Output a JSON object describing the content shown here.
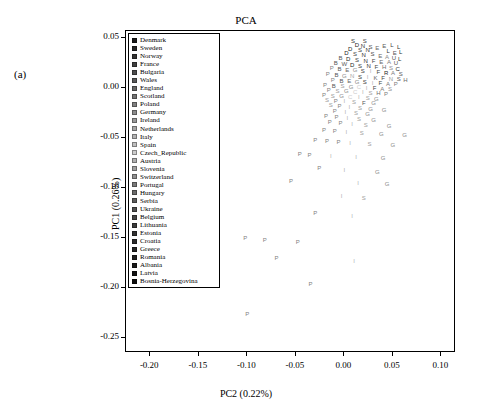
{
  "figure": {
    "panel_label": "(a)",
    "title": "PCA"
  },
  "chart_data": {
    "type": "scatter",
    "title": "PCA",
    "xlabel": "PC2 (0.22%)",
    "ylabel": "PC1 (0.26%)",
    "xlim": [
      -0.225,
      0.115
    ],
    "ylim": [
      -0.265,
      0.057
    ],
    "xticks": [
      "-0.20",
      "-0.15",
      "-0.10",
      "-0.05",
      "0.00",
      "0.05",
      "0.10"
    ],
    "xtickvals": [
      -0.2,
      -0.15,
      -0.1,
      -0.05,
      0.0,
      0.05,
      0.1
    ],
    "yticks": [
      "0.05",
      "0.00",
      "-0.05",
      "-0.10",
      "-0.15",
      "-0.20",
      "-0.25"
    ],
    "ytickvals": [
      0.05,
      0.0,
      -0.05,
      -0.1,
      -0.15,
      -0.2,
      -0.25
    ],
    "grid": false,
    "legend_position": "top-left-inside",
    "legend_title": "",
    "legend": [
      {
        "label": "Denmark",
        "color": "#1a1a1a"
      },
      {
        "label": "Sweden",
        "color": "#262626"
      },
      {
        "label": "Norway",
        "color": "#333333"
      },
      {
        "label": "France",
        "color": "#404040"
      },
      {
        "label": "Bulgaria",
        "color": "#4d4d4d"
      },
      {
        "label": "Wales",
        "color": "#595959"
      },
      {
        "label": "England",
        "color": "#666666"
      },
      {
        "label": "Scotland",
        "color": "#737373"
      },
      {
        "label": "Poland",
        "color": "#808080"
      },
      {
        "label": "Germany",
        "color": "#8c8c8c"
      },
      {
        "label": "Ireland",
        "color": "#999999"
      },
      {
        "label": "Netherlands",
        "color": "#a6a6a6"
      },
      {
        "label": "Italy",
        "color": "#b3b3b3"
      },
      {
        "label": "Spain",
        "color": "#bfbfbf"
      },
      {
        "label": "Czech_Republic",
        "color": "#cccccc"
      },
      {
        "label": "Austria",
        "color": "#b0b0b0"
      },
      {
        "label": "Slovenia",
        "color": "#a0a0a0"
      },
      {
        "label": "Switzerland",
        "color": "#909090"
      },
      {
        "label": "Portugal",
        "color": "#7a7a7a"
      },
      {
        "label": "Hungary",
        "color": "#6b6b6b"
      },
      {
        "label": "Serbia",
        "color": "#5c5c5c"
      },
      {
        "label": "Ukraine",
        "color": "#4f4f4f"
      },
      {
        "label": "Belgium",
        "color": "#444444"
      },
      {
        "label": "Lithuania",
        "color": "#3b3b3b"
      },
      {
        "label": "Estonia",
        "color": "#323232"
      },
      {
        "label": "Croatia",
        "color": "#2b2b2b"
      },
      {
        "label": "Greece",
        "color": "#242424"
      },
      {
        "label": "Romania",
        "color": "#1f1f1f"
      },
      {
        "label": "Albania",
        "color": "#191919"
      },
      {
        "label": "Latvia",
        "color": "#121212"
      },
      {
        "label": "Bosnia-Herzegovina",
        "color": "#0d0d0d"
      }
    ],
    "points": [
      {
        "x": 0.009,
        "y": 0.047,
        "t": "S",
        "c": "#333"
      },
      {
        "x": 0.021,
        "y": 0.047,
        "t": "S",
        "c": "#444"
      },
      {
        "x": 0.013,
        "y": 0.043,
        "t": "D",
        "c": "#222"
      },
      {
        "x": 0.019,
        "y": 0.042,
        "t": "N",
        "c": "#333"
      },
      {
        "x": 0.027,
        "y": 0.041,
        "t": "S",
        "c": "#555"
      },
      {
        "x": 0.006,
        "y": 0.039,
        "t": "D",
        "c": "#222"
      },
      {
        "x": 0.016,
        "y": 0.038,
        "t": "S",
        "c": "#3a3a3a"
      },
      {
        "x": 0.024,
        "y": 0.038,
        "t": "N",
        "c": "#2e2e2e"
      },
      {
        "x": 0.034,
        "y": 0.04,
        "t": "E",
        "c": "#666"
      },
      {
        "x": 0.041,
        "y": 0.042,
        "t": "E",
        "c": "#5a5a5a"
      },
      {
        "x": 0.049,
        "y": 0.043,
        "t": "L",
        "c": "#3a3a3a"
      },
      {
        "x": 0.056,
        "y": 0.041,
        "t": "L",
        "c": "#2a2a2a"
      },
      {
        "x": 0.045,
        "y": 0.037,
        "t": "L",
        "c": "#333"
      },
      {
        "x": 0.052,
        "y": 0.035,
        "t": "E",
        "c": "#555"
      },
      {
        "x": 0.058,
        "y": 0.036,
        "t": "L",
        "c": "#2a2a2a"
      },
      {
        "x": 0.002,
        "y": 0.035,
        "t": "D",
        "c": "#222"
      },
      {
        "x": 0.011,
        "y": 0.034,
        "t": "S",
        "c": "#3f3f3f"
      },
      {
        "x": 0.02,
        "y": 0.033,
        "t": "N",
        "c": "#2c2c2c"
      },
      {
        "x": 0.029,
        "y": 0.034,
        "t": "S",
        "c": "#4a4a4a"
      },
      {
        "x": 0.037,
        "y": 0.032,
        "t": "E",
        "c": "#666"
      },
      {
        "x": 0.044,
        "y": 0.031,
        "t": "A",
        "c": "#888"
      },
      {
        "x": 0.051,
        "y": 0.03,
        "t": "U",
        "c": "#4f4f4f"
      },
      {
        "x": 0.057,
        "y": 0.029,
        "t": "L",
        "c": "#2a2a2a"
      },
      {
        "x": -0.004,
        "y": 0.03,
        "t": "B",
        "c": "#555"
      },
      {
        "x": 0.004,
        "y": 0.029,
        "t": "D",
        "c": "#222"
      },
      {
        "x": 0.013,
        "y": 0.028,
        "t": "S",
        "c": "#3a3a3a"
      },
      {
        "x": 0.022,
        "y": 0.027,
        "t": "N",
        "c": "#2e2e2e"
      },
      {
        "x": 0.03,
        "y": 0.027,
        "t": "F",
        "c": "#444"
      },
      {
        "x": 0.038,
        "y": 0.026,
        "t": "E",
        "c": "#666"
      },
      {
        "x": 0.046,
        "y": 0.026,
        "t": "A",
        "c": "#7a7a7a"
      },
      {
        "x": 0.053,
        "y": 0.025,
        "t": "U",
        "c": "#4f4f4f"
      },
      {
        "x": -0.009,
        "y": 0.025,
        "t": "B",
        "c": "#555"
      },
      {
        "x": 0.0,
        "y": 0.024,
        "t": "W",
        "c": "#5c5c5c"
      },
      {
        "x": 0.008,
        "y": 0.023,
        "t": "D",
        "c": "#222"
      },
      {
        "x": 0.016,
        "y": 0.022,
        "t": "S",
        "c": "#3a3a3a"
      },
      {
        "x": 0.025,
        "y": 0.022,
        "t": "N",
        "c": "#2e2e2e"
      },
      {
        "x": 0.033,
        "y": 0.021,
        "t": "F",
        "c": "#444"
      },
      {
        "x": 0.041,
        "y": 0.021,
        "t": "H",
        "c": "#6b6b6b"
      },
      {
        "x": 0.048,
        "y": 0.02,
        "t": "S",
        "c": "#8c8c8c"
      },
      {
        "x": 0.055,
        "y": 0.019,
        "t": "C",
        "c": "#2b2b2b"
      },
      {
        "x": -0.013,
        "y": 0.02,
        "t": "P",
        "c": "#808080"
      },
      {
        "x": -0.005,
        "y": 0.019,
        "t": "B",
        "c": "#555"
      },
      {
        "x": 0.003,
        "y": 0.018,
        "t": "E",
        "c": "#666"
      },
      {
        "x": 0.011,
        "y": 0.018,
        "t": "G",
        "c": "#8c8c8c"
      },
      {
        "x": 0.019,
        "y": 0.017,
        "t": "S",
        "c": "#3a3a3a"
      },
      {
        "x": 0.027,
        "y": 0.017,
        "t": "I",
        "c": "#b3b3b3"
      },
      {
        "x": 0.035,
        "y": 0.016,
        "t": "F",
        "c": "#444"
      },
      {
        "x": 0.043,
        "y": 0.015,
        "t": "R",
        "c": "#1f1f1f"
      },
      {
        "x": 0.05,
        "y": 0.015,
        "t": "A",
        "c": "#7a7a7a"
      },
      {
        "x": 0.058,
        "y": 0.014,
        "t": "S",
        "c": "#5c5c5c"
      },
      {
        "x": -0.017,
        "y": 0.014,
        "t": "P",
        "c": "#808080"
      },
      {
        "x": -0.008,
        "y": 0.013,
        "t": "B",
        "c": "#555"
      },
      {
        "x": 0.0,
        "y": 0.012,
        "t": "G",
        "c": "#8c8c8c"
      },
      {
        "x": 0.008,
        "y": 0.012,
        "t": "N",
        "c": "#a6a6a6"
      },
      {
        "x": 0.016,
        "y": 0.011,
        "t": "S",
        "c": "#3a3a3a"
      },
      {
        "x": 0.024,
        "y": 0.011,
        "t": "I",
        "c": "#b3b3b3"
      },
      {
        "x": 0.032,
        "y": 0.01,
        "t": "K",
        "c": "#666"
      },
      {
        "x": 0.04,
        "y": 0.01,
        "t": "F",
        "c": "#444"
      },
      {
        "x": 0.048,
        "y": 0.009,
        "t": "N",
        "c": "#999"
      },
      {
        "x": 0.056,
        "y": 0.009,
        "t": "S",
        "c": "#5c5c5c"
      },
      {
        "x": 0.063,
        "y": 0.008,
        "t": "H",
        "c": "#6b6b6b"
      },
      {
        "x": -0.012,
        "y": 0.008,
        "t": "P",
        "c": "#808080"
      },
      {
        "x": -0.003,
        "y": 0.007,
        "t": "B",
        "c": "#555"
      },
      {
        "x": 0.005,
        "y": 0.007,
        "t": "E",
        "c": "#666"
      },
      {
        "x": 0.013,
        "y": 0.006,
        "t": "G",
        "c": "#8c8c8c"
      },
      {
        "x": 0.021,
        "y": 0.006,
        "t": "S",
        "c": "#3a3a3a"
      },
      {
        "x": 0.029,
        "y": 0.005,
        "t": "I",
        "c": "#b3b3b3"
      },
      {
        "x": 0.037,
        "y": 0.005,
        "t": "F",
        "c": "#444"
      },
      {
        "x": 0.045,
        "y": 0.004,
        "t": "A",
        "c": "#7a7a7a"
      },
      {
        "x": 0.053,
        "y": 0.004,
        "t": "P",
        "c": "#7a7a7a"
      },
      {
        "x": -0.02,
        "y": 0.003,
        "t": "P",
        "c": "#808080"
      },
      {
        "x": -0.011,
        "y": 0.002,
        "t": "B",
        "c": "#555"
      },
      {
        "x": -0.002,
        "y": 0.002,
        "t": "S",
        "c": "#999"
      },
      {
        "x": 0.007,
        "y": 0.001,
        "t": "G",
        "c": "#8c8c8c"
      },
      {
        "x": 0.015,
        "y": 0.001,
        "t": "C",
        "c": "#ccc"
      },
      {
        "x": 0.023,
        "y": 0.0,
        "t": "I",
        "c": "#b3b3b3"
      },
      {
        "x": 0.031,
        "y": 0.0,
        "t": "F",
        "c": "#444"
      },
      {
        "x": 0.039,
        "y": -0.001,
        "t": "A",
        "c": "#7a7a7a"
      },
      {
        "x": 0.047,
        "y": -0.001,
        "t": "S",
        "c": "#909090"
      },
      {
        "x": -0.016,
        "y": -0.002,
        "t": "P",
        "c": "#808080"
      },
      {
        "x": -0.007,
        "y": -0.003,
        "t": "S",
        "c": "#999"
      },
      {
        "x": 0.002,
        "y": -0.003,
        "t": "G",
        "c": "#8c8c8c"
      },
      {
        "x": 0.011,
        "y": -0.004,
        "t": "C",
        "c": "#ccc"
      },
      {
        "x": 0.019,
        "y": -0.004,
        "t": "I",
        "c": "#b3b3b3"
      },
      {
        "x": 0.027,
        "y": -0.005,
        "t": "S",
        "c": "#a0a0a0"
      },
      {
        "x": 0.035,
        "y": -0.005,
        "t": "H",
        "c": "#6b6b6b"
      },
      {
        "x": 0.043,
        "y": -0.006,
        "t": "P",
        "c": "#7a7a7a"
      },
      {
        "x": -0.021,
        "y": -0.007,
        "t": "P",
        "c": "#808080"
      },
      {
        "x": -0.012,
        "y": -0.008,
        "t": "S",
        "c": "#999"
      },
      {
        "x": -0.003,
        "y": -0.008,
        "t": "G",
        "c": "#8c8c8c"
      },
      {
        "x": 0.006,
        "y": -0.009,
        "t": "C",
        "c": "#ccc"
      },
      {
        "x": 0.015,
        "y": -0.009,
        "t": "I",
        "c": "#b3b3b3"
      },
      {
        "x": 0.024,
        "y": -0.01,
        "t": "S",
        "c": "#a0a0a0"
      },
      {
        "x": 0.033,
        "y": -0.011,
        "t": "G",
        "c": "#8c8c8c"
      },
      {
        "x": -0.018,
        "y": -0.012,
        "t": "S",
        "c": "#999"
      },
      {
        "x": -0.009,
        "y": -0.013,
        "t": "P",
        "c": "#808080"
      },
      {
        "x": 0.0,
        "y": -0.013,
        "t": "I",
        "c": "#b3b3b3"
      },
      {
        "x": 0.01,
        "y": -0.014,
        "t": "S",
        "c": "#a0a0a0"
      },
      {
        "x": 0.02,
        "y": -0.015,
        "t": "F",
        "c": "#555"
      },
      {
        "x": 0.03,
        "y": -0.015,
        "t": "G",
        "c": "#8c8c8c"
      },
      {
        "x": -0.014,
        "y": -0.017,
        "t": "S",
        "c": "#999"
      },
      {
        "x": -0.005,
        "y": -0.018,
        "t": "P",
        "c": "#808080"
      },
      {
        "x": 0.005,
        "y": -0.019,
        "t": "I",
        "c": "#b3b3b3"
      },
      {
        "x": 0.016,
        "y": -0.02,
        "t": "S",
        "c": "#a0a0a0"
      },
      {
        "x": 0.027,
        "y": -0.021,
        "t": "G",
        "c": "#8c8c8c"
      },
      {
        "x": 0.041,
        "y": -0.022,
        "t": "G",
        "c": "#8c8c8c"
      },
      {
        "x": -0.01,
        "y": -0.023,
        "t": "P",
        "c": "#808080"
      },
      {
        "x": 0.001,
        "y": -0.024,
        "t": "I",
        "c": "#b3b3b3"
      },
      {
        "x": 0.012,
        "y": -0.025,
        "t": "S",
        "c": "#a0a0a0"
      },
      {
        "x": 0.024,
        "y": -0.026,
        "t": "G",
        "c": "#8c8c8c"
      },
      {
        "x": -0.019,
        "y": -0.028,
        "t": "P",
        "c": "#808080"
      },
      {
        "x": -0.008,
        "y": -0.029,
        "t": "P",
        "c": "#808080"
      },
      {
        "x": 0.003,
        "y": -0.03,
        "t": "I",
        "c": "#b3b3b3"
      },
      {
        "x": 0.015,
        "y": -0.031,
        "t": "S",
        "c": "#a0a0a0"
      },
      {
        "x": 0.03,
        "y": -0.032,
        "t": "G",
        "c": "#8c8c8c"
      },
      {
        "x": -0.015,
        "y": -0.034,
        "t": "P",
        "c": "#808080"
      },
      {
        "x": -0.004,
        "y": -0.035,
        "t": "P",
        "c": "#808080"
      },
      {
        "x": 0.008,
        "y": -0.036,
        "t": "I",
        "c": "#b3b3b3"
      },
      {
        "x": 0.022,
        "y": -0.037,
        "t": "S",
        "c": "#a0a0a0"
      },
      {
        "x": 0.046,
        "y": -0.038,
        "t": "G",
        "c": "#8c8c8c"
      },
      {
        "x": -0.021,
        "y": -0.042,
        "t": "P",
        "c": "#808080"
      },
      {
        "x": -0.01,
        "y": -0.043,
        "t": "P",
        "c": "#808080"
      },
      {
        "x": 0.002,
        "y": -0.044,
        "t": "I",
        "c": "#b3b3b3"
      },
      {
        "x": 0.018,
        "y": -0.045,
        "t": "S",
        "c": "#a0a0a0"
      },
      {
        "x": 0.038,
        "y": -0.046,
        "t": "G",
        "c": "#8c8c8c"
      },
      {
        "x": 0.062,
        "y": -0.047,
        "t": "G",
        "c": "#8c8c8c"
      },
      {
        "x": -0.03,
        "y": -0.052,
        "t": "P",
        "c": "#808080"
      },
      {
        "x": -0.018,
        "y": -0.053,
        "t": "P",
        "c": "#808080"
      },
      {
        "x": -0.006,
        "y": -0.054,
        "t": "P",
        "c": "#808080"
      },
      {
        "x": 0.006,
        "y": -0.055,
        "t": "I",
        "c": "#b3b3b3"
      },
      {
        "x": 0.026,
        "y": -0.056,
        "t": "S",
        "c": "#a0a0a0"
      },
      {
        "x": 0.05,
        "y": -0.057,
        "t": "G",
        "c": "#8c8c8c"
      },
      {
        "x": -0.046,
        "y": -0.066,
        "t": "P",
        "c": "#808080"
      },
      {
        "x": -0.036,
        "y": -0.067,
        "t": "P",
        "c": "#808080"
      },
      {
        "x": -0.014,
        "y": -0.068,
        "t": "I",
        "c": "#b3b3b3"
      },
      {
        "x": 0.012,
        "y": -0.069,
        "t": "I",
        "c": "#b3b3b3"
      },
      {
        "x": 0.04,
        "y": -0.07,
        "t": "G",
        "c": "#8c8c8c"
      },
      {
        "x": -0.026,
        "y": -0.08,
        "t": "P",
        "c": "#808080"
      },
      {
        "x": 0.0,
        "y": -0.082,
        "t": "I",
        "c": "#b3b3b3"
      },
      {
        "x": 0.034,
        "y": -0.084,
        "t": "G",
        "c": "#8c8c8c"
      },
      {
        "x": -0.055,
        "y": -0.093,
        "t": "P",
        "c": "#808080"
      },
      {
        "x": 0.014,
        "y": -0.095,
        "t": "I",
        "c": "#b3b3b3"
      },
      {
        "x": 0.044,
        "y": -0.096,
        "t": "G",
        "c": "#8c8c8c"
      },
      {
        "x": -0.003,
        "y": -0.108,
        "t": "I",
        "c": "#b3b3b3"
      },
      {
        "x": 0.02,
        "y": -0.11,
        "t": "S",
        "c": "#a0a0a0"
      },
      {
        "x": -0.03,
        "y": -0.125,
        "t": "P",
        "c": "#808080"
      },
      {
        "x": 0.008,
        "y": -0.128,
        "t": "I",
        "c": "#b3b3b3"
      },
      {
        "x": -0.102,
        "y": -0.15,
        "t": "P",
        "c": "#808080"
      },
      {
        "x": -0.082,
        "y": -0.152,
        "t": "P",
        "c": "#808080"
      },
      {
        "x": -0.048,
        "y": -0.154,
        "t": "P",
        "c": "#808080"
      },
      {
        "x": -0.07,
        "y": -0.17,
        "t": "P",
        "c": "#808080"
      },
      {
        "x": 0.01,
        "y": -0.173,
        "t": "I",
        "c": "#b3b3b3"
      },
      {
        "x": -0.035,
        "y": -0.196,
        "t": "P",
        "c": "#808080"
      },
      {
        "x": -0.1,
        "y": -0.226,
        "t": "P",
        "c": "#808080"
      }
    ]
  }
}
